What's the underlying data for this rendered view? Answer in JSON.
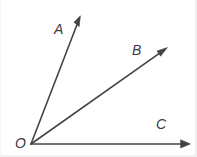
{
  "figure": {
    "canvas": {
      "width": 197,
      "height": 157,
      "background": "#ffffff"
    },
    "stroke_color": "#434349",
    "label_color": "#3b3b42",
    "vertex": {
      "label": "O",
      "x": 31,
      "y": 144
    },
    "rays": [
      {
        "name": "ray-OA",
        "label": "A",
        "from": {
          "x": 31,
          "y": 144
        },
        "to": {
          "x": 80,
          "y": 17
        },
        "label_position": {
          "x": 54,
          "y": 22
        },
        "arrowhead": true
      },
      {
        "name": "ray-OB",
        "label": "B",
        "from": {
          "x": 31,
          "y": 144
        },
        "to": {
          "x": 167,
          "y": 48
        },
        "label_position": {
          "x": 132,
          "y": 43
        },
        "arrowhead": true
      },
      {
        "name": "ray-OC",
        "label": "C",
        "from": {
          "x": 31,
          "y": 144
        },
        "to": {
          "x": 190,
          "y": 144
        },
        "label_position": {
          "x": 156,
          "y": 117
        },
        "arrowhead": true
      }
    ],
    "labels": {
      "A": "A",
      "B": "B",
      "C": "C",
      "O": "O"
    }
  }
}
